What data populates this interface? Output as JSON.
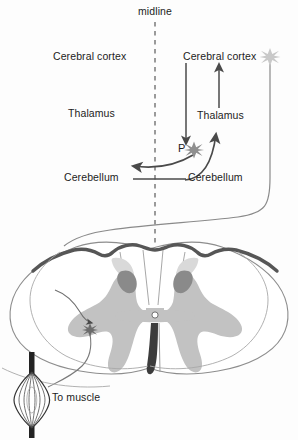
{
  "figure": {
    "midline_label": "midline"
  },
  "labels": {
    "midline": "midline",
    "left_cerebral_cortex": "Cerebral cortex",
    "left_thalamus": "Thalamus",
    "left_cerebellum": "Cerebellum",
    "right_cerebral_cortex": "Cerebral cortex",
    "right_thalamus": "Thalamus",
    "right_cerebellum": "Cerebellum",
    "pontine_nucleus": "P",
    "to_muscle": "To muscle"
  },
  "structures": {
    "spinal_cord": "spinal cord cross-section",
    "gray_matter": "butterfly-shaped gray matter",
    "dorsal_horn_patch": "dorsal horn dark patch",
    "central_canal": "central canal",
    "ventral_fissure": "ventral median fissure",
    "muscle_spindle": "muscle spindle",
    "motor_neuron": "ventral horn motor neuron",
    "cortical_neuron": "cortical projection neuron",
    "pontine_neuron": "pontine relay neuron"
  },
  "colors": {
    "ink": "#1c1c1c",
    "outline": "#6f6f6f",
    "dark_border": "#565656",
    "gray_matter": "#bdbdbd",
    "dark_patch": "#8a8a8a",
    "pale_gray": "#d8d8d8",
    "arrow": "#4a4a4a",
    "star_light": "#c9c9c9",
    "background": "#fdfdfd"
  },
  "geometry": {
    "width": 298,
    "height": 440,
    "midline_x": 155,
    "midline_dash_top": 22,
    "midline_dash_bottom": 258
  }
}
